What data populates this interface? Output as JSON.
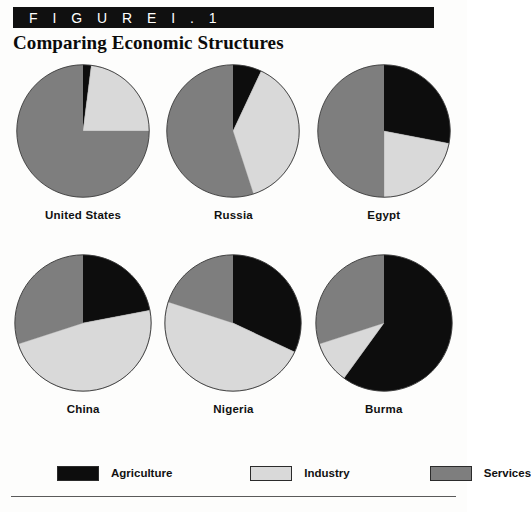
{
  "figure": {
    "badge_label": "F I G U R E   I . 1",
    "title": "Comparing Economic Structures"
  },
  "colors": {
    "agriculture": "#0d0d0d",
    "industry": "#d9d9d9",
    "services": "#7e7e7e",
    "outline": "#3a3a3a",
    "badge_background": "#101010",
    "badge_text": "#ffffff",
    "rule": "#5a5a5a"
  },
  "legend": {
    "items": [
      {
        "label": "Agriculture",
        "color": "#0d0d0d",
        "swatch": "agriculture-swatch"
      },
      {
        "label": "Industry",
        "color": "#d9d9d9",
        "swatch": "industry-swatch"
      },
      {
        "label": "Services",
        "color": "#7e7e7e",
        "swatch": "services-swatch"
      }
    ]
  },
  "chart_data": {
    "type": "pie",
    "title": "Comparing Economic Structures",
    "subtitle": "FIGURE I.1",
    "categories": [
      "Agriculture",
      "Industry",
      "Services"
    ],
    "category_colors": [
      "#0d0d0d",
      "#d9d9d9",
      "#7e7e7e"
    ],
    "units": "percent of GDP",
    "legend_position": "bottom",
    "start_angle_deg": 0,
    "direction": "clockwise",
    "charts": [
      {
        "name": "United States",
        "values": [
          2,
          23,
          75
        ]
      },
      {
        "name": "Russia",
        "values": [
          7,
          38,
          55
        ]
      },
      {
        "name": "Egypt",
        "values": [
          28,
          22,
          50
        ]
      },
      {
        "name": "China",
        "values": [
          22,
          48,
          30
        ]
      },
      {
        "name": "Nigeria",
        "values": [
          32,
          48,
          20
        ]
      },
      {
        "name": "Burma",
        "values": [
          60,
          10,
          30
        ]
      }
    ]
  }
}
